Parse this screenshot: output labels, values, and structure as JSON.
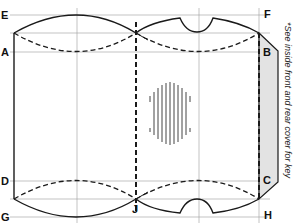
{
  "diagram": {
    "type": "pillow-box template",
    "labels": {
      "E": "E",
      "F": "F",
      "A": "A",
      "B": "B",
      "D": "D",
      "C": "C",
      "G": "G",
      "H": "H",
      "J": "J"
    },
    "note": "*See inside front and rear cover for key",
    "colors": {
      "line": "#1a1a1a",
      "guide": "#9a9a9a",
      "flap_fill": "#e3e3e3",
      "hatch": "#444444",
      "background": "#ffffff"
    }
  }
}
